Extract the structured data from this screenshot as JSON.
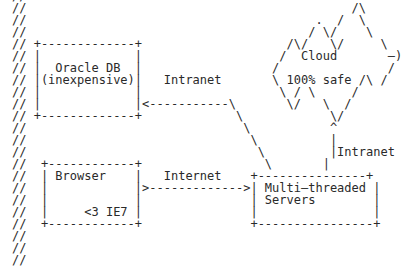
{
  "diagram": {
    "type": "ascii-architecture",
    "nodes": [
      {
        "id": "oracle",
        "label": "Oracle DB",
        "sublabel": "(inexpensive)"
      },
      {
        "id": "cloud",
        "label": "Cloud",
        "sublabel": "100% safe"
      },
      {
        "id": "browser",
        "label": "Browser",
        "sublabel": "<3 IE7"
      },
      {
        "id": "servers",
        "label": "Multi-threaded",
        "sublabel": "Servers"
      }
    ],
    "edges": [
      {
        "from": "servers",
        "to": "oracle",
        "label": "Intranet"
      },
      {
        "from": "servers",
        "to": "cloud",
        "label": "Intranet"
      },
      {
        "from": "browser",
        "to": "servers",
        "label": "Internet"
      }
    ],
    "lines": [
      "//",
      "//                                             /\\",
      "//                                        .  /  \\",
      "//                                       / \\/    \\",
      "// +-------------+                    /\\/   \\/     \\",
      "// |             |                   /  Cloud       —)",
      "// |  Oracle DB  |                  /               /",
      "// |(inexpensive)|   Intranet       \\ 100% safe /\\ /",
      "// |             |                   \\ / \\     /  ",
      "// |             |<-----------\\       \\/   \\  /",
      "// +-------------+             \\            \\/",
      "//                              \\           ^",
      "//                               \\          |",
      "//                                \\         |Intranet",
      "//  +------------+                 \\       |",
      "//  | Browser    |   Internet    +---------------+",
      "//  |            |>------------->| Multi—threaded |",
      "//  |            |               | Servers        |",
      "//  |     <3 IE7 |               |                |",
      "//  +------------+               +----------------+",
      "//",
      "//",
      "//"
    ]
  }
}
